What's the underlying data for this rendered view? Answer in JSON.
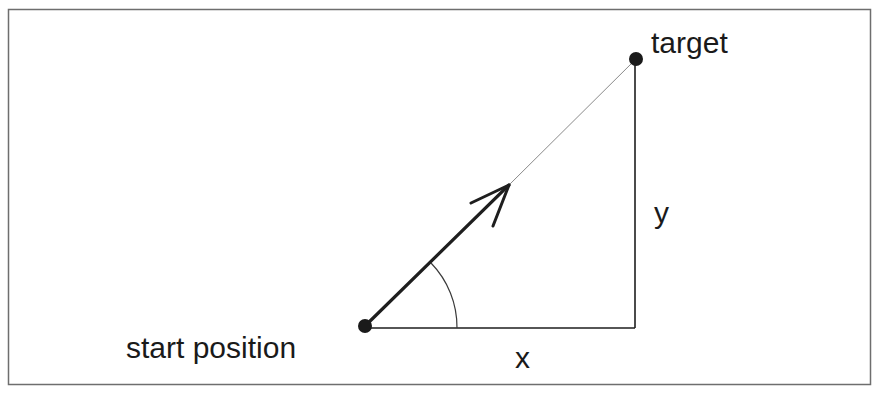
{
  "diagram": {
    "labels": {
      "target": "target",
      "start": "start position",
      "x_axis": "x",
      "y_axis": "y"
    },
    "points": {
      "start": {
        "x": 365,
        "y": 326
      },
      "target": {
        "x": 636,
        "y": 59
      },
      "arrow_tip": {
        "x": 509,
        "y": 185
      },
      "corner": {
        "x": 635,
        "y": 328
      }
    },
    "colors": {
      "frame": "#6e6e6e",
      "line": "#1e1e1e",
      "thin_line": "#8a8a8a",
      "dot": "#1a1a1a",
      "text": "#1a1a1a"
    }
  }
}
